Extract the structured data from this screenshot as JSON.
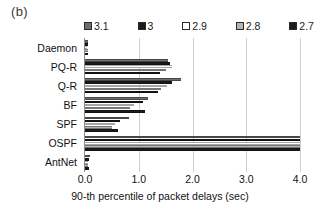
{
  "panel": {
    "label": "(b)"
  },
  "chart_data": {
    "type": "bar",
    "orientation": "horizontal",
    "title": "",
    "subtitle": "",
    "xlabel": "90-th percentile of packet delays (sec)",
    "ylabel": "",
    "xlim": [
      0.0,
      4.0
    ],
    "ylim": null,
    "grid": true,
    "grid_axis": "x",
    "legend_position": "top",
    "xticks": [
      "0.0",
      "1.0",
      "2.0",
      "3.0",
      "4.0"
    ],
    "xtick_values": [
      0.0,
      1.0,
      2.0,
      3.0,
      4.0
    ],
    "categories": [
      "Daemon",
      "PQ-R",
      "Q-R",
      "BF",
      "SPF",
      "OSPF",
      "AntNet"
    ],
    "series": [
      {
        "name": "3.1",
        "color": "#6e6e6e",
        "values": [
          0.06,
          1.55,
          1.78,
          1.18,
          0.82,
          4.0,
          0.09
        ]
      },
      {
        "name": "3",
        "color": "#1c1c1c",
        "values": [
          0.05,
          1.58,
          1.62,
          1.08,
          0.66,
          4.0,
          0.07
        ]
      },
      {
        "name": "2.9",
        "color": "#ffffff",
        "values": [
          0.04,
          1.62,
          1.52,
          0.92,
          0.56,
          4.0,
          0.05
        ]
      },
      {
        "name": "2.8",
        "color": "#b4b4b4",
        "values": [
          0.05,
          1.5,
          1.42,
          0.84,
          0.5,
          4.0,
          0.06
        ]
      },
      {
        "name": "2.7",
        "color": "#1c1c1c",
        "values": [
          0.06,
          1.4,
          1.35,
          1.12,
          0.62,
          4.0,
          0.08
        ]
      }
    ]
  },
  "legend": {
    "items": [
      {
        "label": "3.1",
        "color": "#6e6e6e"
      },
      {
        "label": "3",
        "color": "#1c1c1c"
      },
      {
        "label": "2.9",
        "color": "#ffffff"
      },
      {
        "label": "2.8",
        "color": "#b4b4b4"
      },
      {
        "label": "2.7",
        "color": "#1c1c1c"
      }
    ]
  },
  "axis": {
    "x_label": "90-th percentile of packet delays (sec)"
  }
}
